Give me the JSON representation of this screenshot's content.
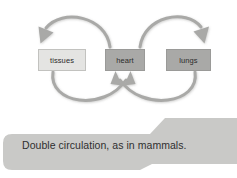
{
  "diagram": {
    "nodes": [
      {
        "id": "tissues",
        "label": "tissues",
        "fill": "#e4e4e2",
        "border": "#c2c2bf"
      },
      {
        "id": "heart",
        "label": "heart",
        "fill": "#a9a9a7",
        "border": "#9a9a98"
      },
      {
        "id": "lungs",
        "label": "lungs",
        "fill": "#a9a9a7",
        "border": "#9a9a98"
      }
    ],
    "arrows": [
      {
        "id": "heart-to-tissues",
        "from": "heart",
        "to": "tissues",
        "path": "top-left-loop",
        "direction": "leftward"
      },
      {
        "id": "heart-to-lungs",
        "from": "heart",
        "to": "lungs",
        "path": "top-right-loop",
        "direction": "rightward"
      },
      {
        "id": "tissues-to-heart",
        "from": "tissues",
        "to": "heart",
        "path": "bottom-left-loop",
        "direction": "upward"
      },
      {
        "id": "lungs-to-heart",
        "from": "lungs",
        "to": "heart",
        "path": "bottom-right-loop",
        "direction": "upward"
      }
    ],
    "arrow_color": "#a9a9a7",
    "arrow_width": 3
  },
  "caption": {
    "text": "Double circulation, as in mammals.",
    "background": "#c9c9c7"
  },
  "canvas": {
    "background": "#ffffff",
    "width": 237,
    "height": 178
  }
}
